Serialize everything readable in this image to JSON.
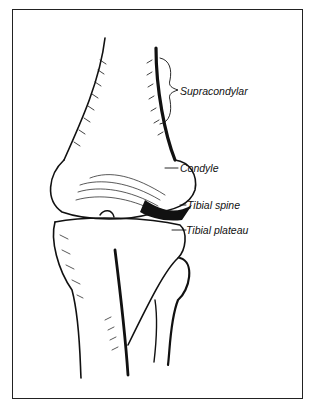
{
  "figure": {
    "labels": [
      {
        "id": "supracondylar",
        "text": "Supracondylar"
      },
      {
        "id": "condyle",
        "text": "Condyle"
      },
      {
        "id": "tibial_spine",
        "text": "Tibial spine"
      },
      {
        "id": "tibial_plateau",
        "text": "Tibial plateau"
      }
    ],
    "colors": {
      "ink": "#111111",
      "background": "#ffffff"
    }
  }
}
